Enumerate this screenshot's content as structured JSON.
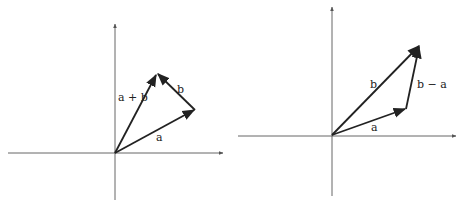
{
  "diagrams": [
    {
      "title": "vector addition",
      "labels": {
        "a": "a",
        "b": "b",
        "sum": "a + b"
      }
    },
    {
      "title": "vector subtraction",
      "labels": {
        "a": "a",
        "b": "b",
        "diff": "b − a"
      }
    }
  ],
  "colors": {
    "ink": "#222222",
    "axis": "#555555",
    "background": "#ffffff"
  }
}
